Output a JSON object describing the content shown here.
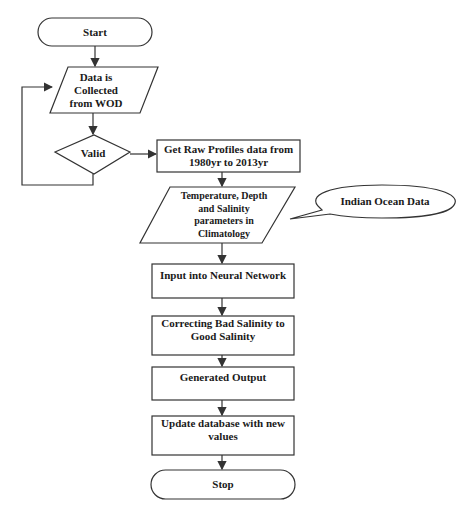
{
  "flowchart": {
    "nodes": {
      "start": {
        "label": "Start",
        "shape": "terminator"
      },
      "collect": {
        "label": "Data is Collected from WOD",
        "shape": "parallelogram"
      },
      "valid": {
        "label": "Valid",
        "shape": "decision"
      },
      "raw": {
        "label": "Get Raw Profiles data from 1980yr to 2013yr",
        "shape": "process"
      },
      "params": {
        "label": "Temperature, Depth and Salinity parameters in Climatology",
        "shape": "parallelogram"
      },
      "callout": {
        "label": "Indian Ocean Data",
        "shape": "callout"
      },
      "nn": {
        "label": "Input into Neural Network",
        "shape": "process"
      },
      "correct": {
        "label": "Correcting Bad Salinity to Good Salinity",
        "shape": "process"
      },
      "output": {
        "label": "Generated Output",
        "shape": "process"
      },
      "update": {
        "label": "Update database with new values",
        "shape": "process"
      },
      "stop": {
        "label": "Stop",
        "shape": "terminator"
      }
    },
    "edges": [
      [
        "start",
        "collect"
      ],
      [
        "collect",
        "valid"
      ],
      [
        "valid",
        "raw"
      ],
      [
        "valid",
        "collect"
      ],
      [
        "raw",
        "params"
      ],
      [
        "params",
        "nn"
      ],
      [
        "nn",
        "correct"
      ],
      [
        "correct",
        "output"
      ],
      [
        "output",
        "update"
      ],
      [
        "update",
        "stop"
      ]
    ],
    "colors": {
      "stroke": "#333333",
      "fill": "#ffffff",
      "text": "#1a1a1a"
    }
  }
}
